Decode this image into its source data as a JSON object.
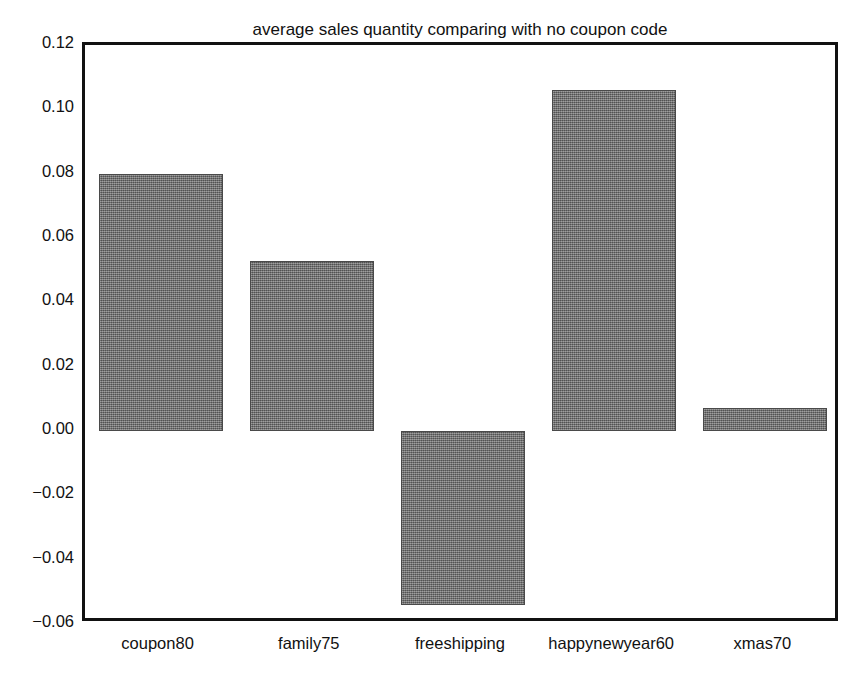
{
  "chart_data": {
    "type": "bar",
    "title": "average sales quantity comparing with no coupon code",
    "xlabel": "",
    "ylabel": "",
    "categories": [
      "coupon80",
      "family75",
      "freeshipping",
      "happynewyear60",
      "xmas70"
    ],
    "values": [
      0.08,
      0.053,
      -0.054,
      0.106,
      0.007
    ],
    "series": [
      {
        "name": "average sales quantity",
        "values": [
          0.08,
          0.053,
          -0.054,
          0.106,
          0.007
        ]
      }
    ],
    "ylim": [
      -0.06,
      0.12
    ],
    "yticks": [
      0.12,
      0.1,
      0.08,
      0.06,
      0.04,
      0.02,
      0.0,
      -0.02,
      -0.04,
      -0.06
    ],
    "ytick_labels": [
      "0.12",
      "0.10",
      "0.08",
      "0.06",
      "0.04",
      "0.02",
      "0.00",
      "-0.02",
      "-0.04",
      "-0.06"
    ],
    "grid": false,
    "legend": null,
    "baseline": 0.0,
    "bar_color": "#6f6f6f",
    "bar_edge_color": "#4a4a4a",
    "axis_color": "#111111",
    "background_color": "#ffffff",
    "annotations": []
  }
}
